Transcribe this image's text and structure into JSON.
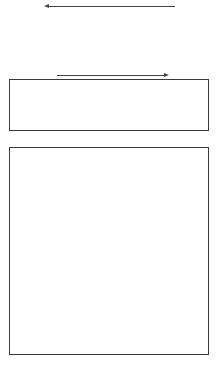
{
  "diagram": {
    "top_arrow": {
      "direction": "left"
    },
    "middle_arrow": {
      "direction": "right"
    },
    "top_row": {
      "type": "A",
      "blocks": [
        {
          "light": "#c8c8c8",
          "dark": "#5a5a5a",
          "mid": "#9a9a9a"
        },
        {
          "light": "#cbcbcb",
          "dark": "#555555",
          "mid": "#8a8a8a"
        },
        {
          "light": "#d0d0d0",
          "dark": "#3a3a3a",
          "mid": "#7a7a7a"
        },
        {
          "light": "#a8a8a8",
          "dark": "#161616",
          "mid": "#6a6a6a"
        }
      ]
    },
    "middle_strip": {
      "type": "B",
      "blocks": [
        {
          "light": "#c8c8c8",
          "dark": "#3a3a3a",
          "mid": "#7a7a7a"
        },
        {
          "light": "#bcbcbc",
          "dark": "#131313",
          "mid": "#555555"
        },
        {
          "light": "#bdbdbd",
          "dark": "#555555",
          "mid": "#7a7a7a"
        },
        {
          "light": "#cccccc",
          "dark": "#5a5a5a",
          "mid": "#8a8a8a"
        }
      ]
    },
    "quilt_grid": {
      "rows": [
        {
          "type": "A",
          "blocks": [
            {
              "light": "#c0c0c0",
              "dark": "#4a4a4a",
              "mid": "#7a7a7a"
            },
            {
              "light": "#d0d0d0",
              "dark": "#555555",
              "mid": "#8a8a8a"
            },
            {
              "light": "#d8d8d8",
              "dark": "#111111",
              "mid": "#555555"
            },
            {
              "light": "#a8a8a8",
              "dark": "#6a6a6a",
              "mid": "#888888"
            }
          ]
        },
        {
          "type": "B",
          "blocks": [
            {
              "light": "#d8d8d8",
              "dark": "#555555",
              "mid": "#8a8a8a"
            },
            {
              "light": "#cccccc",
              "dark": "#111111",
              "mid": "#555555"
            },
            {
              "light": "#aaaaaa",
              "dark": "#666666",
              "mid": "#888888"
            },
            {
              "light": "#dddddd",
              "dark": "#5a5a5a",
              "mid": "#8a8a8a"
            }
          ]
        },
        {
          "type": "A",
          "blocks": [
            {
              "light": "#c8c8c8",
              "dark": "#444444",
              "mid": "#7a7a7a"
            },
            {
              "light": "#dddddd",
              "dark": "#555555",
              "mid": "#8a8a8a"
            },
            {
              "light": "#cccccc",
              "dark": "#111111",
              "mid": "#555555"
            },
            {
              "light": "#dddddd",
              "dark": "#666666",
              "mid": "#8a8a8a"
            }
          ]
        },
        {
          "type": "B",
          "blocks": [
            {
              "light": "#dddddd",
              "dark": "#555555",
              "mid": "#8a8a8a"
            },
            {
              "light": "#c8c8c8",
              "dark": "#444444",
              "mid": "#7a7a7a"
            },
            {
              "light": "#bbbbbb",
              "dark": "#444444",
              "mid": "#7a7a7a"
            },
            {
              "light": "#dddddd",
              "dark": "#151515",
              "mid": "#555555"
            }
          ]
        }
      ]
    }
  }
}
